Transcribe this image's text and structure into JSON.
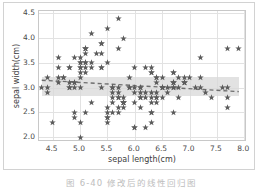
{
  "figure": {
    "caption": "图 6-40   修改后的线性回归图",
    "background_color": "#ffffff",
    "border_color": "#d2d2d2"
  },
  "axes": {
    "xlabel": "sepal length(cm)",
    "ylabel": "sepal width(cm)",
    "xticks": [
      "4.5",
      "5.0",
      "5.5",
      "6.0",
      "6.5",
      "7.0",
      "7.5",
      "8.0"
    ],
    "yticks": [
      "2.0",
      "2.5",
      "3.0",
      "3.5",
      "4.0",
      "4.5"
    ],
    "xlim": [
      4.25,
      8.05
    ],
    "ylim": [
      1.9,
      4.55
    ],
    "grid": true,
    "grid_color": "#e2e2e2"
  },
  "style": {
    "marker_color": "#5b5b5b",
    "marker_symbol": "star",
    "line_color": "#6e6e6e",
    "line_style": "dashed",
    "band_color": "#d8d8d8"
  },
  "chart_data": {
    "type": "scatter",
    "title": "",
    "xlabel": "sepal length(cm)",
    "ylabel": "sepal width(cm)",
    "xlim": [
      4.25,
      8.05
    ],
    "ylim": [
      1.9,
      4.55
    ],
    "grid": true,
    "legend": null,
    "marker": "star",
    "regression": {
      "style": "dashed",
      "x": [
        4.3,
        7.9
      ],
      "y": [
        3.15,
        2.92
      ],
      "confidence_band": {
        "x": [
          4.3,
          5.0,
          5.6,
          6.2,
          6.8,
          7.3,
          7.9
        ],
        "upper": [
          3.22,
          3.14,
          3.09,
          3.05,
          3.02,
          3.01,
          3.0
        ],
        "lower": [
          3.07,
          3.05,
          3.02,
          2.99,
          2.93,
          2.88,
          2.83
        ]
      }
    },
    "x": [
      5.1,
      4.9,
      4.7,
      4.6,
      5.0,
      5.4,
      4.6,
      5.0,
      4.4,
      4.9,
      5.4,
      4.8,
      4.8,
      4.3,
      5.8,
      5.7,
      5.4,
      5.1,
      5.7,
      5.1,
      5.4,
      5.1,
      4.6,
      5.1,
      4.8,
      5.0,
      5.0,
      5.2,
      5.2,
      4.7,
      4.8,
      5.4,
      5.2,
      5.5,
      4.9,
      5.0,
      5.5,
      4.9,
      4.4,
      5.1,
      5.0,
      4.5,
      4.4,
      5.0,
      5.1,
      4.8,
      5.1,
      4.6,
      5.3,
      5.0,
      7.0,
      6.4,
      6.9,
      5.5,
      6.5,
      5.7,
      6.3,
      4.9,
      6.6,
      5.2,
      5.0,
      5.9,
      6.0,
      6.1,
      5.6,
      6.7,
      5.6,
      5.8,
      6.2,
      5.6,
      5.9,
      6.1,
      6.3,
      6.1,
      6.4,
      6.6,
      6.8,
      6.7,
      6.0,
      5.7,
      5.5,
      5.5,
      5.8,
      6.0,
      5.4,
      6.0,
      6.7,
      6.3,
      5.6,
      5.5,
      5.5,
      6.1,
      5.8,
      5.0,
      5.6,
      5.7,
      5.7,
      6.2,
      5.1,
      5.7,
      6.3,
      5.8,
      7.1,
      6.3,
      6.5,
      7.6,
      4.9,
      7.3,
      6.7,
      7.2,
      6.5,
      6.4,
      6.8,
      5.7,
      5.8,
      6.4,
      6.5,
      7.7,
      7.7,
      6.0,
      6.9,
      5.6,
      7.7,
      6.3,
      6.7,
      7.2,
      6.2,
      6.1,
      6.4,
      7.2,
      7.4,
      7.9,
      6.4,
      6.3,
      6.1,
      7.7,
      6.3,
      6.4,
      6.0,
      6.9,
      6.7,
      6.9,
      5.8,
      6.8,
      6.7,
      6.7,
      6.3,
      6.5,
      6.2,
      5.9
    ],
    "y": [
      3.5,
      3.0,
      3.2,
      3.1,
      3.6,
      3.9,
      3.4,
      3.4,
      2.9,
      3.1,
      3.7,
      3.4,
      3.0,
      3.0,
      4.0,
      4.4,
      3.9,
      3.5,
      3.8,
      3.8,
      3.4,
      3.7,
      3.6,
      3.3,
      3.4,
      3.0,
      3.4,
      3.5,
      3.4,
      3.2,
      3.1,
      3.4,
      4.1,
      4.2,
      3.1,
      3.2,
      3.5,
      3.6,
      3.0,
      3.4,
      3.5,
      2.3,
      3.2,
      3.5,
      3.8,
      3.0,
      3.8,
      3.2,
      3.7,
      3.3,
      3.2,
      3.2,
      3.1,
      2.3,
      2.8,
      2.8,
      3.3,
      2.4,
      2.9,
      2.7,
      2.0,
      3.0,
      2.2,
      2.9,
      2.9,
      3.1,
      3.0,
      2.7,
      2.2,
      2.5,
      3.2,
      2.8,
      2.5,
      2.8,
      2.9,
      3.0,
      2.8,
      3.0,
      2.9,
      2.6,
      2.4,
      2.4,
      2.7,
      2.7,
      3.0,
      3.4,
      3.1,
      2.3,
      3.0,
      2.5,
      2.6,
      3.0,
      2.6,
      2.3,
      2.7,
      3.0,
      2.9,
      2.9,
      2.5,
      2.8,
      3.3,
      2.7,
      3.0,
      2.9,
      3.0,
      3.0,
      2.5,
      2.9,
      2.5,
      3.6,
      3.2,
      2.7,
      3.0,
      2.5,
      2.8,
      3.2,
      3.0,
      3.8,
      2.6,
      2.2,
      3.2,
      2.8,
      2.8,
      2.7,
      3.3,
      3.2,
      2.8,
      3.0,
      2.8,
      3.0,
      2.8,
      3.8,
      2.8,
      2.8,
      2.6,
      3.0,
      3.4,
      3.1,
      3.0,
      3.1,
      3.1,
      3.1,
      2.7,
      3.2,
      3.3,
      3.0,
      2.5,
      3.0,
      3.4,
      3.0
    ]
  }
}
